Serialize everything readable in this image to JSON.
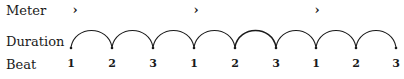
{
  "labels": {
    "meter": "Meter",
    "duration": "Duration",
    "beat": "Beat"
  },
  "meter": {
    "accent_icon": "accent-chevron",
    "accent_symbol": "›",
    "positions": [
      1,
      4,
      7
    ]
  },
  "duration": {
    "arc_count": 8,
    "dot_count": 9
  },
  "beats": [
    "1",
    "2",
    "3",
    "1",
    "2",
    "3",
    "1",
    "2",
    "3"
  ],
  "colors": {
    "ink": "#1a1a1a",
    "background": "#ffffff"
  }
}
